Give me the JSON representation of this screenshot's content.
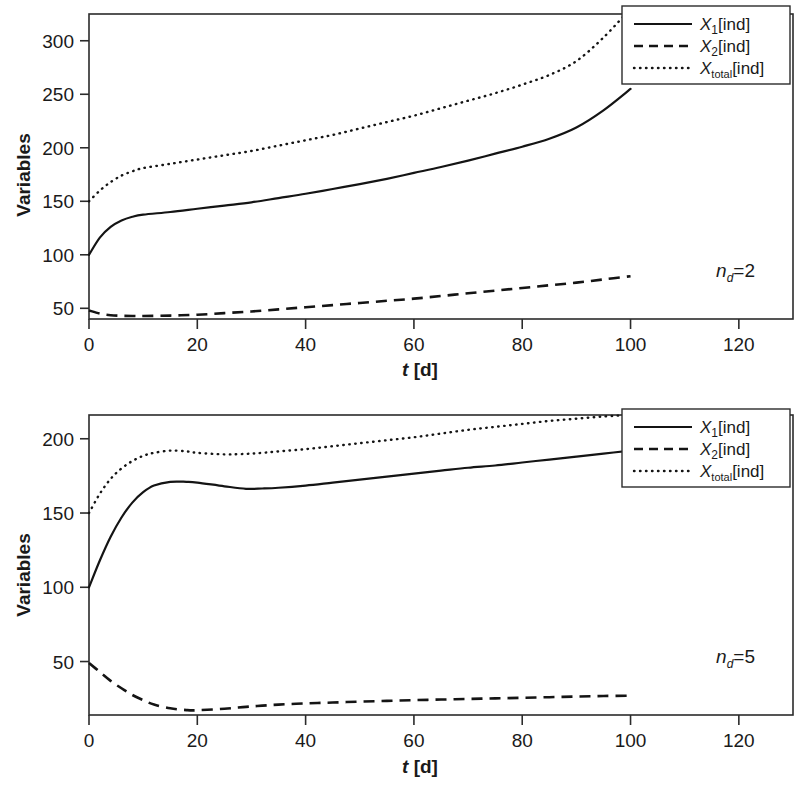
{
  "figure": {
    "background": "#ffffff",
    "line_color": "#141414",
    "panels": [
      "top",
      "bottom"
    ]
  },
  "chart_data": [
    {
      "panel": "top",
      "type": "line",
      "title": "",
      "xlabel": "t [d]",
      "ylabel": "Variables",
      "xlim": [
        0,
        130
      ],
      "ylim": [
        40,
        325
      ],
      "xticks": [
        0,
        20,
        40,
        60,
        80,
        100,
        120
      ],
      "yticks": [
        50,
        100,
        150,
        200,
        250,
        300
      ],
      "grid": false,
      "legend_position": "top-right",
      "annotation": "n_d=2",
      "annotation_parts": {
        "symbol": "n",
        "subscript": "d",
        "equals": "=",
        "value": "2"
      },
      "x": [
        0,
        2,
        4,
        6,
        8,
        10,
        15,
        20,
        25,
        30,
        35,
        40,
        45,
        50,
        55,
        60,
        65,
        70,
        75,
        80,
        85,
        90,
        95,
        100
      ],
      "series": [
        {
          "name": "X_1[ind]",
          "label_base": "X",
          "label_sub": "1",
          "label_unit": "[ind]",
          "style": "solid",
          "values": [
            100,
            116,
            126,
            132,
            135.5,
            137.5,
            140,
            143,
            146,
            149,
            153,
            157,
            161.5,
            166,
            171,
            176.5,
            182,
            188,
            194.5,
            201,
            208.5,
            219,
            235,
            255
          ]
        },
        {
          "name": "X_2[ind]",
          "label_base": "X",
          "label_sub": "2",
          "label_unit": "[ind]",
          "style": "dashed",
          "values": [
            48,
            45,
            43.5,
            43,
            42.8,
            42.8,
            43.2,
            44,
            45.5,
            47,
            49,
            51,
            53,
            55,
            57,
            59,
            61.5,
            64,
            66.5,
            69,
            71.5,
            74,
            77,
            80
          ]
        },
        {
          "name": "X_total[ind]",
          "label_base": "X",
          "label_sub": "total",
          "label_unit": "[ind]",
          "style": "dotted",
          "values": [
            150,
            160,
            168,
            174,
            178,
            181,
            185,
            189,
            193,
            197,
            202,
            207,
            212,
            218,
            224,
            230,
            237,
            244,
            251,
            259,
            268,
            281,
            303,
            330
          ]
        }
      ]
    },
    {
      "panel": "bottom",
      "type": "line",
      "title": "",
      "xlabel": "t [d]",
      "ylabel": "Variables",
      "xlim": [
        0,
        130
      ],
      "ylim": [
        14,
        216
      ],
      "xticks": [
        0,
        20,
        40,
        60,
        80,
        100,
        120
      ],
      "yticks": [
        50,
        100,
        150,
        200
      ],
      "grid": false,
      "legend_position": "top-right",
      "annotation": "n_d=5",
      "annotation_parts": {
        "symbol": "n",
        "subscript": "d",
        "equals": "=",
        "value": "5"
      },
      "x": [
        0,
        2,
        4,
        6,
        8,
        10,
        12,
        15,
        18,
        20,
        25,
        29,
        32,
        35,
        40,
        45,
        50,
        55,
        60,
        65,
        70,
        75,
        80,
        85,
        90,
        95,
        100
      ],
      "series": [
        {
          "name": "X_1[ind]",
          "label_base": "X",
          "label_sub": "1",
          "label_unit": "[ind]",
          "style": "solid",
          "values": [
            100,
            118,
            134,
            147,
            157,
            164,
            168.5,
            171,
            171,
            170.5,
            168,
            166.3,
            166.5,
            167,
            168.5,
            170.5,
            172.5,
            174.5,
            176.5,
            178.5,
            180.5,
            182,
            184,
            186,
            188,
            190,
            192
          ]
        },
        {
          "name": "X_2[ind]",
          "label_base": "X",
          "label_sub": "2",
          "label_unit": "[ind]",
          "style": "dashed",
          "values": [
            49,
            43,
            37,
            32,
            27.5,
            24,
            21,
            18.5,
            17.3,
            17.2,
            18.2,
            19.5,
            20.3,
            21,
            21.8,
            22.4,
            23,
            23.5,
            24,
            24.4,
            24.8,
            25.2,
            25.6,
            26,
            26.4,
            26.8,
            27
          ]
        },
        {
          "name": "X_total[ind]",
          "label_base": "X",
          "label_sub": "total",
          "label_unit": "[ind]",
          "style": "dotted",
          "values": [
            150,
            163,
            173,
            180,
            185,
            188.5,
            190.5,
            192,
            191.5,
            190.5,
            189.5,
            189.8,
            190.5,
            191.5,
            193,
            195,
            197,
            199,
            201,
            203.5,
            206,
            208,
            210,
            212,
            213.5,
            215,
            216
          ]
        }
      ]
    }
  ]
}
